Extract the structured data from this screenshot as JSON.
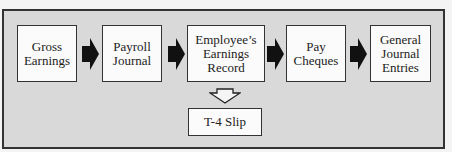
{
  "diagram": {
    "nodes": [
      {
        "id": "gross",
        "label": "Gross Earnings"
      },
      {
        "id": "payroll",
        "label": "Payroll Journal"
      },
      {
        "id": "employee",
        "label": "Employee's Earnings Record"
      },
      {
        "id": "pay",
        "label": "Pay Cheques"
      },
      {
        "id": "general",
        "label": "General Journal Entries"
      },
      {
        "id": "t4",
        "label": "T-4 Slip"
      }
    ],
    "labels": {
      "gross_l1": "Gross",
      "gross_l2": "Earnings",
      "payroll_l1": "Payroll",
      "payroll_l2": "Journal",
      "employee_l1": "Employee’s",
      "employee_l2": "Earnings",
      "employee_l3": "Record",
      "pay_l1": "Pay",
      "pay_l2": "Cheques",
      "general_l1": "General",
      "general_l2": "Journal",
      "general_l3": "Entries",
      "t4": "T-4 Slip"
    },
    "edges": [
      {
        "from": "gross",
        "to": "payroll"
      },
      {
        "from": "payroll",
        "to": "employee"
      },
      {
        "from": "employee",
        "to": "pay"
      },
      {
        "from": "pay",
        "to": "general"
      },
      {
        "from": "employee",
        "to": "t4",
        "style": "hollow"
      }
    ],
    "colors": {
      "background": "#d9d9d9",
      "box": "#fbfbfb",
      "border": "#333333",
      "arrow": "#111111"
    }
  }
}
